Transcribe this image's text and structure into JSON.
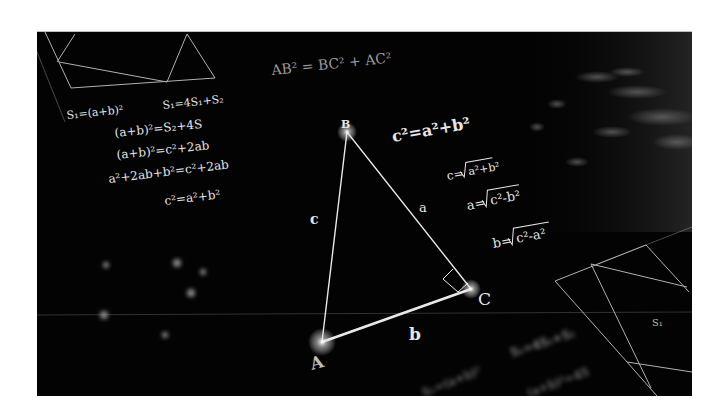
{
  "image": {
    "subject": "Pythagorean theorem illustration",
    "background_color": "#030303",
    "page_background": "#ffffff",
    "line_color": "#e0e0e0"
  },
  "triangle": {
    "vertices": {
      "A": {
        "label": "A",
        "x": 285,
        "y": 310
      },
      "B": {
        "label": "B",
        "x": 310,
        "y": 100
      },
      "C": {
        "label": "C",
        "x": 434,
        "y": 257
      }
    },
    "sides": {
      "a": "a",
      "b": "b",
      "c": "c"
    },
    "right_angle_at": "C"
  },
  "formulas": {
    "top": "AB² = BC² + AC²",
    "left": [
      "S₁=(a+b)²",
      "S₁=4S₁+S₂",
      "(a+b)²=S₂+4S",
      "(a+b)²=c²+2ab",
      "a²+2ab+b²=c²+2ab",
      "c²=a²+b²"
    ],
    "right": {
      "main": "c²=a²+b²",
      "c": {
        "lhs": "c=",
        "rad": "a²+b²"
      },
      "a": {
        "lhs": "a=",
        "rad": "c²-b²"
      },
      "b": {
        "lhs": "b=",
        "rad": "c²-a²"
      }
    },
    "bottom": [
      "S₁=4S₁+S₂",
      "S₁=(a+b)²",
      "(a+b)²=4S"
    ],
    "diagram_label": "S₁"
  }
}
